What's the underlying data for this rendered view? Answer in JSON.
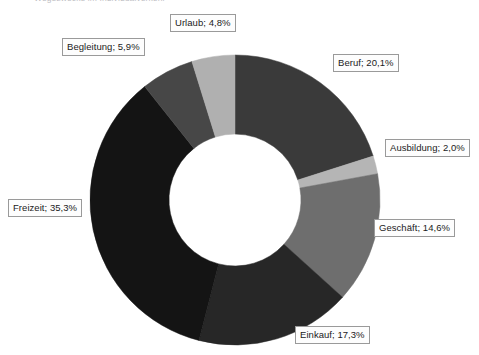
{
  "chart_title": "Wegezwecke im Individualverkehr",
  "chart_data": {
    "type": "pie",
    "variant": "donut",
    "title": "Wegezwecke im Individualverkehr",
    "xlabel": "",
    "ylabel": "",
    "legend_position": "none",
    "grid": false,
    "value_unit": "%",
    "decimal_separator": ",",
    "label_format": "{name}; {value}%",
    "start_angle_deg": 0,
    "direction": "clockwise",
    "inner_radius_ratio": 0.455,
    "categories": [
      "Beruf",
      "Ausbildung",
      "Geschäft",
      "Einkauf",
      "Freizeit",
      "Begleitung",
      "Urlaub"
    ],
    "values": [
      20.1,
      2.0,
      14.6,
      17.3,
      35.3,
      5.9,
      4.8
    ],
    "colors": [
      "#3a3a3a",
      "#b5b5b5",
      "#6e6e6e",
      "#272727",
      "#141414",
      "#474747",
      "#b0b0b0"
    ],
    "slices": [
      {
        "name": "Beruf",
        "value": 20.1,
        "label": "Beruf; 20,1%",
        "color": "#3a3a3a"
      },
      {
        "name": "Ausbildung",
        "value": 2.0,
        "label": "Ausbildung; 2,0%",
        "color": "#b5b5b5"
      },
      {
        "name": "Geschäft",
        "value": 14.6,
        "label": "Geschäft; 14,6%",
        "color": "#6e6e6e"
      },
      {
        "name": "Einkauf",
        "value": 17.3,
        "label": "Einkauf; 17,3%",
        "color": "#272727"
      },
      {
        "name": "Freizeit",
        "value": 35.3,
        "label": "Freizeit; 35,3%",
        "color": "#141414"
      },
      {
        "name": "Begleitung",
        "value": 5.9,
        "label": "Begleitung; 5,9%",
        "color": "#474747"
      },
      {
        "name": "Urlaub",
        "value": 4.8,
        "label": "Urlaub; 4,8%",
        "color": "#b0b0b0"
      }
    ],
    "total": 100.0
  },
  "labels": {
    "urlaub": "Urlaub; 4,8%",
    "begleitung": "Begleitung; 5,9%",
    "beruf": "Beruf; 20,1%",
    "ausbildung": "Ausbildung; 2,0%",
    "geschaeft": "Geschäft; 14,6%",
    "freizeit": "Freizeit; 35,3%",
    "einkauf": "Einkauf; 17,3%"
  }
}
